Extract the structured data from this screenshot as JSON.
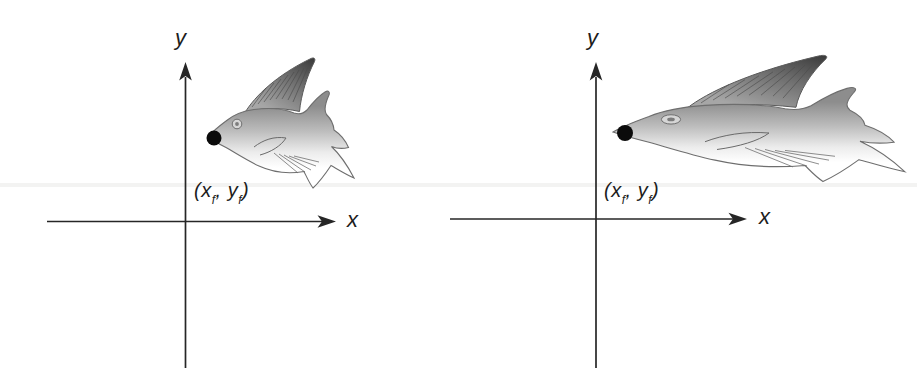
{
  "figure": {
    "background": "#ffffff",
    "content": "two coordinate systems each showing a fish anchored at a fixed point; right fish is scaled wider"
  },
  "axes": {
    "x_label": "x",
    "y_label": "y"
  },
  "fixed_point_label": {
    "pre": "(x",
    "sub1": "f",
    "mid": ", y",
    "sub2": "f",
    "post": ")"
  },
  "panels": {
    "left": {
      "fish_variant": "original"
    },
    "right": {
      "fish_variant": "scaled-horizontally"
    }
  },
  "icons": {
    "fish_illustration": "fish",
    "fixed_point_marker": "filled-circle",
    "arrowhead": "solid-triangle-arrowhead"
  },
  "colors": {
    "axis": "#262626",
    "label_text": "#1c1c1c",
    "fixed_point_dot": "#0b0b0b",
    "fish_outline": "#6e6e6e",
    "fin_dark": "#3c3c3c",
    "body_top_gray": "#8d8d8d",
    "body_bottom_white": "#ffffff"
  }
}
